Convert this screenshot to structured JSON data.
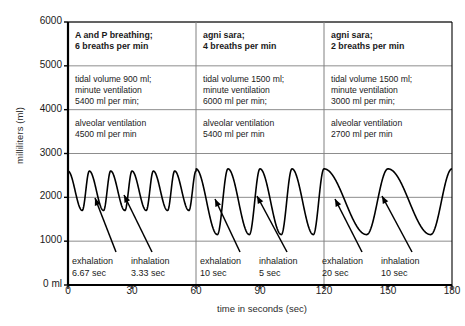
{
  "chart_data": {
    "type": "line",
    "title": "",
    "xlabel": "time in seconds (sec)",
    "ylabel": "milliliters (ml)",
    "xlim": [
      0,
      180
    ],
    "ylim": [
      0,
      6000
    ],
    "xticks": [
      0,
      30,
      60,
      90,
      120,
      150,
      180
    ],
    "yticks": [
      0,
      1000,
      2000,
      3000,
      4000,
      5000,
      6000
    ],
    "ytick_labels": [
      "0 ml",
      "1000",
      "2000",
      "3000",
      "4000",
      "5000",
      "6000"
    ],
    "xtick_labels": [
      "0",
      "30",
      "60",
      "90",
      "120",
      "150",
      "180"
    ],
    "grid": true,
    "legend": "none",
    "series": [
      {
        "name": "lung volume",
        "description": "Continuous breathing waveform (lung volume vs time) across three breathing regimes.",
        "segments": [
          {
            "t_start": 0,
            "t_end": 60,
            "breaths_per_min": 6,
            "period_sec": 10,
            "peak_ml": 2600,
            "trough_ml": 1700,
            "tidal_volume_ml": 900,
            "exhalation_sec": 6.67,
            "inhalation_sec": 3.33
          },
          {
            "t_start": 60,
            "t_end": 120,
            "breaths_per_min": 4,
            "period_sec": 15,
            "peak_ml": 2650,
            "trough_ml": 1150,
            "tidal_volume_ml": 1500,
            "exhalation_sec": 10,
            "inhalation_sec": 5
          },
          {
            "t_start": 120,
            "t_end": 180,
            "breaths_per_min": 2,
            "period_sec": 30,
            "peak_ml": 2650,
            "trough_ml": 1150,
            "tidal_volume_ml": 1500,
            "exhalation_sec": 20,
            "inhalation_sec": 10
          }
        ]
      }
    ],
    "panel_dividers_sec": [
      60,
      120
    ],
    "panels": [
      {
        "header": [
          "A and P breathing;",
          "6 breaths per min"
        ],
        "row2": [
          "tidal volume 900 ml;",
          "minute ventilation",
          "5400 ml per min;"
        ],
        "row3": [
          "alveolar ventilation",
          "4500 ml per min"
        ],
        "annotations": [
          {
            "label": "exhalation",
            "value": "6.67 sec"
          },
          {
            "label": "inhalation",
            "value": "3.33 sec"
          }
        ]
      },
      {
        "header": [
          "agni sara;",
          "4 breaths per min"
        ],
        "row2": [
          "tidal volume 1500 ml;",
          "minute ventilation",
          "6000 ml per min;"
        ],
        "row3": [
          "alveolar ventilation",
          "5400 ml per min"
        ],
        "annotations": [
          {
            "label": "exhalation",
            "value": "10 sec"
          },
          {
            "label": "inhalation",
            "value": "5 sec"
          }
        ]
      },
      {
        "header": [
          "agni sara;",
          "2 breaths per min"
        ],
        "row2": [
          "tidal volume 1500 ml;",
          "minute ventilation",
          "3000 ml per min;"
        ],
        "row3": [
          "alveolar ventilation",
          "2700 ml per min"
        ],
        "annotations": [
          {
            "label": "exhalation",
            "value": "20 sec"
          },
          {
            "label": "inhalation",
            "value": "10 sec"
          }
        ]
      }
    ],
    "colors": {
      "line": "#000000",
      "axis": "#000000",
      "grid": "#808080",
      "text": "#1a1a1a",
      "background": "#ffffff"
    }
  }
}
